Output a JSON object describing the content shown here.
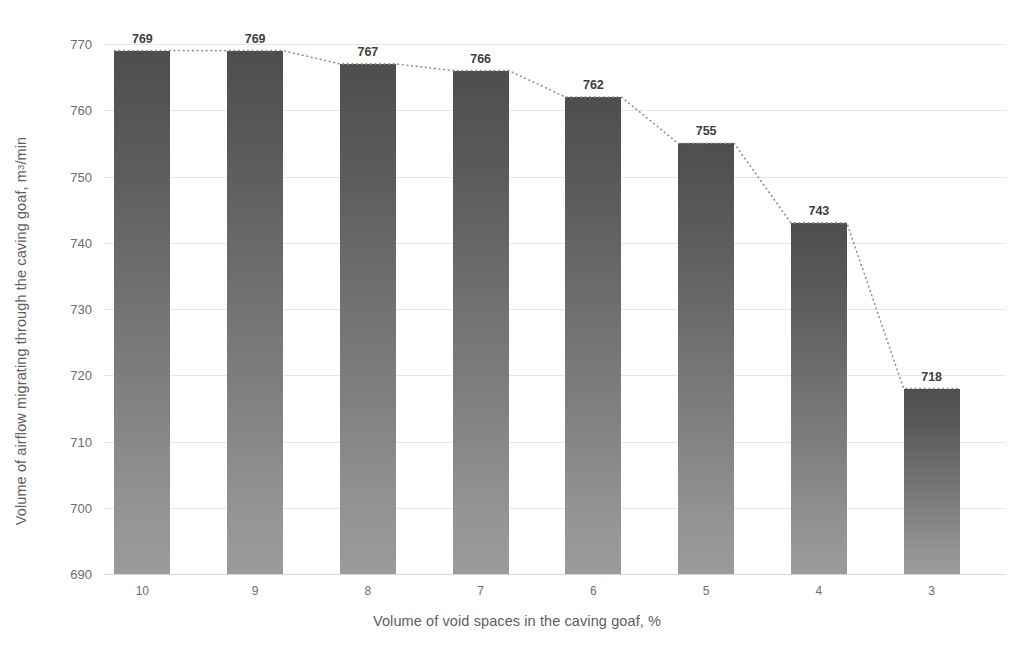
{
  "chart_data": {
    "type": "bar",
    "title": "",
    "categories": [
      "10",
      "9",
      "8",
      "7",
      "6",
      "5",
      "4",
      "3"
    ],
    "values": [
      769,
      769,
      767,
      766,
      762,
      755,
      743,
      718
    ],
    "xlabel": "Volume of void spaces in the caving goaf, %",
    "ylabel_prefix": "Volume of airflow migrating through the caving goaf, m",
    "ylabel_sup": "3",
    "ylabel_suffix": "/min",
    "ylabel": "Volume of airflow migrating through the caving goaf, m3/min",
    "ylim": [
      690,
      770
    ],
    "yticks": [
      770,
      760,
      750,
      740,
      730,
      720,
      710,
      700,
      690
    ],
    "ytick_labels": [
      "770",
      "760",
      "750",
      "740",
      "730",
      "720",
      "710",
      "700",
      "690"
    ],
    "grid": true,
    "legend": "none",
    "data_labels": [
      "769",
      "769",
      "767",
      "766",
      "762",
      "755",
      "743",
      "718"
    ],
    "series": [
      {
        "name": "Volume of airflow migrating through the caving goaf",
        "values": [
          769,
          769,
          767,
          766,
          762,
          755,
          743,
          718
        ]
      },
      {
        "name": "trendline",
        "style": "dotted",
        "values": [
          769,
          769,
          767,
          766,
          762,
          755,
          743,
          718
        ]
      }
    ],
    "colors": {
      "bar_top": "#4e4e4e",
      "bar_bottom": "#9b9b9b",
      "gridline": "#e4e7ea",
      "trendline": "#8c8c8c",
      "label_text": "#3f3f3f",
      "axis_text": "#6d6d6d",
      "title_text": "#5e5e5e",
      "background": "#ffffff"
    }
  }
}
